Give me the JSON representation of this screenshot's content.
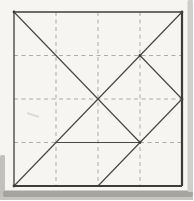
{
  "figure": {
    "type": "line-diagram",
    "canvas": {
      "width": 193,
      "height": 200
    },
    "square": {
      "left": 14,
      "top": 12,
      "right": 182,
      "bottom": 186
    },
    "dash_pattern": "4 3.5",
    "colors": {
      "paper": "#f6f5f1",
      "solid_line": "#4a4842",
      "outline": "#3e3c38",
      "dashed_line": "#a5a49e",
      "right_scan_band": "#cfcecb",
      "bottom_scan_band": "#a5a49f",
      "bottom_scan_strip": "#c6c5c0",
      "left_scan_sliver": "#c2c1bc",
      "smudge": "#dcdbd4"
    },
    "outline_edges": [
      {
        "name": "square-top-edge",
        "x1": 14,
        "y1": 12,
        "x2": 182,
        "y2": 12,
        "w": 1.3
      },
      {
        "name": "square-left-edge",
        "x1": 14,
        "y1": 12,
        "x2": 14,
        "y2": 186,
        "w": 1.3
      },
      {
        "name": "square-right-edge",
        "x1": 182,
        "y1": 12,
        "x2": 182,
        "y2": 186,
        "w": 2.2
      },
      {
        "name": "square-bottom-edge",
        "x1": 14,
        "y1": 186,
        "x2": 182,
        "y2": 186,
        "w": 2.2
      }
    ],
    "solid_segments": [
      {
        "name": "main-diagonal-three-quarter",
        "x1": 14,
        "y1": 12,
        "x2": 140,
        "y2": 142.5
      },
      {
        "name": "anti-diagonal-full",
        "x1": 182,
        "y1": 12,
        "x2": 14,
        "y2": 186
      },
      {
        "name": "small-triangle-cut",
        "x1": 140,
        "y1": 55.5,
        "x2": 182,
        "y2": 99
      },
      {
        "name": "right-mid-to-bottom-mid-cut",
        "x1": 182,
        "y1": 99,
        "x2": 98,
        "y2": 186
      },
      {
        "name": "horizontal-three-quarter-cut",
        "x1": 56,
        "y1": 142.5,
        "x2": 140,
        "y2": 142.5
      }
    ],
    "dashed_segments": [
      {
        "name": "fold-vertical-quarter",
        "x1": 56,
        "y1": 12,
        "x2": 56,
        "y2": 186
      },
      {
        "name": "fold-vertical-center",
        "x1": 98,
        "y1": 12,
        "x2": 98,
        "y2": 186
      },
      {
        "name": "fold-vertical-three-quarter",
        "x1": 140,
        "y1": 12,
        "x2": 140,
        "y2": 186
      },
      {
        "name": "fold-horizontal-quarter",
        "x1": 14,
        "y1": 55.5,
        "x2": 182,
        "y2": 55.5
      },
      {
        "name": "fold-horizontal-center",
        "x1": 14,
        "y1": 99,
        "x2": 182,
        "y2": 99
      },
      {
        "name": "fold-horizontal-three-quarter-left",
        "x1": 14,
        "y1": 142.5,
        "x2": 56,
        "y2": 142.5
      },
      {
        "name": "fold-horizontal-three-quarter-right",
        "x1": 140,
        "y1": 142.5,
        "x2": 182,
        "y2": 142.5
      }
    ],
    "vertex_dots": [
      {
        "name": "vertex-top-left-corner",
        "x": 14,
        "y": 12
      },
      {
        "name": "vertex-top-right-corner",
        "x": 182,
        "y": 12
      },
      {
        "name": "vertex-bottom-left-corner",
        "x": 14,
        "y": 186
      },
      {
        "name": "vertex-upper-cut-junction",
        "x": 140,
        "y": 55.5
      },
      {
        "name": "vertex-right-mid-edge",
        "x": 182,
        "y": 99
      },
      {
        "name": "vertex-lower-cut-junction",
        "x": 140,
        "y": 142.5
      }
    ],
    "smudge_segment": {
      "name": "pencil-smudge",
      "x1": 27,
      "y1": 113,
      "x2": 39,
      "y2": 117
    }
  }
}
